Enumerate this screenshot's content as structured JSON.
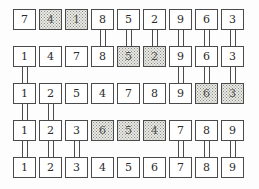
{
  "figure": {
    "title": "",
    "rows": 5,
    "columns": 9,
    "colors": {
      "border": "#4a4a4a",
      "cell_background": "#ffffff",
      "shaded_background": "#e9e9e4",
      "text": "#2b2b2b",
      "page_background": "#ffffff"
    },
    "cells": [
      [
        {
          "value": "7",
          "shaded": false
        },
        {
          "value": "4",
          "shaded": true
        },
        {
          "value": "1",
          "shaded": true
        },
        {
          "value": "8",
          "shaded": false
        },
        {
          "value": "5",
          "shaded": false
        },
        {
          "value": "2",
          "shaded": false
        },
        {
          "value": "9",
          "shaded": false
        },
        {
          "value": "6",
          "shaded": false
        },
        {
          "value": "3",
          "shaded": false
        }
      ],
      [
        {
          "value": "1",
          "shaded": false
        },
        {
          "value": "4",
          "shaded": false
        },
        {
          "value": "7",
          "shaded": false
        },
        {
          "value": "8",
          "shaded": false
        },
        {
          "value": "5",
          "shaded": true
        },
        {
          "value": "2",
          "shaded": true
        },
        {
          "value": "9",
          "shaded": false
        },
        {
          "value": "6",
          "shaded": false
        },
        {
          "value": "3",
          "shaded": false
        }
      ],
      [
        {
          "value": "1",
          "shaded": false
        },
        {
          "value": "2",
          "shaded": false
        },
        {
          "value": "5",
          "shaded": false
        },
        {
          "value": "4",
          "shaded": false
        },
        {
          "value": "7",
          "shaded": false
        },
        {
          "value": "8",
          "shaded": false
        },
        {
          "value": "9",
          "shaded": false
        },
        {
          "value": "6",
          "shaded": true
        },
        {
          "value": "3",
          "shaded": true
        }
      ],
      [
        {
          "value": "1",
          "shaded": false
        },
        {
          "value": "2",
          "shaded": false
        },
        {
          "value": "3",
          "shaded": false
        },
        {
          "value": "6",
          "shaded": true
        },
        {
          "value": "5",
          "shaded": true
        },
        {
          "value": "4",
          "shaded": true
        },
        {
          "value": "7",
          "shaded": false
        },
        {
          "value": "8",
          "shaded": false
        },
        {
          "value": "9",
          "shaded": false
        }
      ],
      [
        {
          "value": "1",
          "shaded": false
        },
        {
          "value": "2",
          "shaded": false
        },
        {
          "value": "3",
          "shaded": false
        },
        {
          "value": "4",
          "shaded": false
        },
        {
          "value": "5",
          "shaded": false
        },
        {
          "value": "6",
          "shaded": false
        },
        {
          "value": "7",
          "shaded": false
        },
        {
          "value": "8",
          "shaded": false
        },
        {
          "value": "9",
          "shaded": false
        }
      ]
    ],
    "connectors": [
      {
        "gap": 0,
        "columns": [
          3,
          4,
          5,
          6,
          7,
          8
        ]
      },
      {
        "gap": 1,
        "columns": [
          0,
          6,
          7,
          8
        ]
      },
      {
        "gap": 2,
        "columns": [
          0,
          1
        ]
      },
      {
        "gap": 3,
        "columns": [
          0,
          1,
          2,
          6,
          7,
          8
        ]
      }
    ],
    "geometry": {
      "origin_x": 13,
      "origin_y": 9,
      "col_step": 26,
      "row_step": 37,
      "cell_width": 23,
      "cell_height": 21
    }
  }
}
